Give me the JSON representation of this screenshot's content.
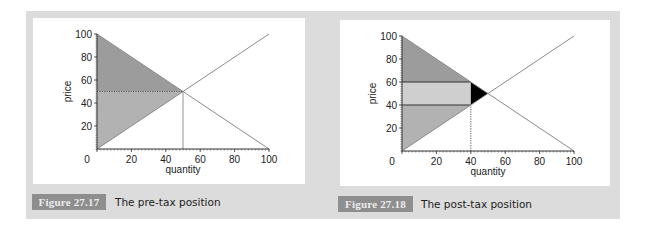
{
  "figures": [
    {
      "label": "Figure 27.17",
      "caption": "The pre-tax position"
    },
    {
      "label": "Figure 27.18",
      "caption": "The post-tax position"
    }
  ],
  "colors": {
    "panel": "#dcdcdc",
    "consumer_surplus": "#9c9c9c",
    "producer_surplus": "#b2b2b2",
    "tax_revenue": "#cfcfcf",
    "deadweight_loss": "#000000",
    "curve": "#8a8a8a",
    "label_box": "#8e8e8e"
  },
  "chart_data": [
    {
      "type": "line",
      "title": "The pre-tax position",
      "figure_label": "Figure 27.17",
      "xlabel": "quantity",
      "ylabel": "price",
      "xlim": [
        0,
        100
      ],
      "ylim": [
        0,
        100
      ],
      "x_ticks": [
        0,
        20,
        40,
        60,
        80,
        100
      ],
      "y_ticks": [
        20,
        40,
        60,
        80,
        100
      ],
      "grid": false,
      "series": [
        {
          "name": "demand",
          "x": [
            0,
            100
          ],
          "y": [
            100,
            0
          ]
        },
        {
          "name": "supply",
          "x": [
            0,
            100
          ],
          "y": [
            0,
            100
          ]
        }
      ],
      "equilibrium": {
        "quantity": 50,
        "price": 50
      },
      "shaded_regions": [
        {
          "name": "consumer surplus",
          "polygon": [
            [
              0,
              100
            ],
            [
              50,
              50
            ],
            [
              0,
              50
            ]
          ],
          "color": "#9c9c9c"
        },
        {
          "name": "producer surplus",
          "polygon": [
            [
              0,
              50
            ],
            [
              50,
              50
            ],
            [
              0,
              0
            ]
          ],
          "color": "#b2b2b2"
        }
      ],
      "reference_lines": [
        {
          "type": "horizontal",
          "y": 50,
          "from_x": 0,
          "to_x": 50,
          "style": "dotted"
        },
        {
          "type": "vertical",
          "x": 50,
          "from_y": 0,
          "to_y": 50,
          "style": "solid-thin"
        }
      ]
    },
    {
      "type": "line",
      "title": "The post-tax position",
      "figure_label": "Figure 27.18",
      "xlabel": "quantity",
      "ylabel": "price",
      "xlim": [
        0,
        100
      ],
      "ylim": [
        0,
        100
      ],
      "x_ticks": [
        0,
        20,
        40,
        60,
        80,
        100
      ],
      "y_ticks": [
        20,
        40,
        60,
        80,
        100
      ],
      "grid": false,
      "series": [
        {
          "name": "demand",
          "x": [
            0,
            100
          ],
          "y": [
            100,
            0
          ]
        },
        {
          "name": "supply",
          "x": [
            0,
            100
          ],
          "y": [
            0,
            100
          ]
        }
      ],
      "post_tax_quantity": 40,
      "buyer_price": 60,
      "seller_price": 40,
      "shaded_regions": [
        {
          "name": "consumer surplus",
          "polygon": [
            [
              0,
              100
            ],
            [
              40,
              60
            ],
            [
              0,
              60
            ]
          ],
          "color": "#9c9c9c"
        },
        {
          "name": "tax revenue",
          "polygon": [
            [
              0,
              60
            ],
            [
              40,
              60
            ],
            [
              40,
              40
            ],
            [
              0,
              40
            ]
          ],
          "color": "#cfcfcf"
        },
        {
          "name": "producer surplus",
          "polygon": [
            [
              0,
              40
            ],
            [
              40,
              40
            ],
            [
              0,
              0
            ]
          ],
          "color": "#b2b2b2"
        },
        {
          "name": "deadweight loss",
          "polygon": [
            [
              40,
              60
            ],
            [
              50,
              50
            ],
            [
              40,
              40
            ]
          ],
          "color": "#000000"
        }
      ],
      "reference_lines": [
        {
          "type": "horizontal",
          "y": 60,
          "from_x": 0,
          "to_x": 40,
          "style": "solid"
        },
        {
          "type": "horizontal",
          "y": 40,
          "from_x": 0,
          "to_x": 40,
          "style": "solid"
        },
        {
          "type": "vertical",
          "x": 40,
          "from_y": 0,
          "to_y": 40,
          "style": "dotted"
        }
      ]
    }
  ]
}
